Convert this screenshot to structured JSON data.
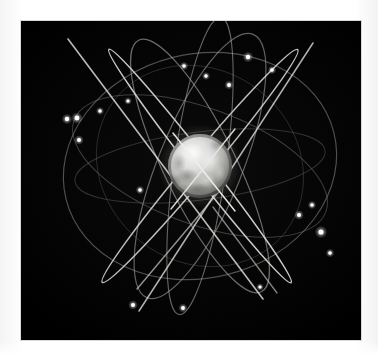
{
  "image": {
    "kind": "astronomy-render",
    "caption": "Satellite constellation orbiting a planet",
    "background_color": "#ffffff",
    "plate_color": "#000000",
    "plate": {
      "x": 21,
      "y": 21,
      "width": 340,
      "height": 319
    }
  },
  "planet": {
    "name": "planet-earth",
    "center_x": 200,
    "center_y": 166,
    "radius": 32,
    "highlight_color": "#f2f2f0",
    "midtone_color": "#b9b9b6",
    "shadow_color": "#2a2a2a",
    "terminator_side": "left-bottom"
  },
  "orbits": {
    "ring_color": "#9a9a9a",
    "bright_color": "#e8e8e4",
    "dim_color": "#5a5a5a",
    "items": [
      {
        "id": "orbit-1",
        "type": "ellipse",
        "label": "Inclined orbital plane 1",
        "rx": 138,
        "ry": 112,
        "rotate": -14,
        "opacity": 0.55
      },
      {
        "id": "orbit-2",
        "type": "ellipse",
        "label": "Inclined orbital plane 2",
        "rx": 134,
        "ry": 58,
        "rotate": 20,
        "opacity": 0.5
      },
      {
        "id": "orbit-3",
        "type": "ellipse",
        "label": "Inclined orbital plane 3",
        "rx": 126,
        "ry": 36,
        "rotate": -8,
        "opacity": 0.45
      },
      {
        "id": "orbit-4",
        "type": "ellipse",
        "label": "Polar orbital plane 4",
        "rx": 40,
        "ry": 142,
        "rotate": 22,
        "opacity": 0.7
      },
      {
        "id": "orbit-5",
        "type": "ellipse",
        "label": "Polar orbital plane 5",
        "rx": 34,
        "ry": 140,
        "rotate": -26,
        "opacity": 0.72
      },
      {
        "id": "orbit-6",
        "type": "ellipse",
        "label": "Edge-on orbital plane 6",
        "rx": 12,
        "ry": 150,
        "rotate": 40,
        "opacity": 0.85
      },
      {
        "id": "orbit-7",
        "type": "ellipse",
        "label": "Edge-on orbital plane 7",
        "rx": 10,
        "ry": 146,
        "rotate": -38,
        "opacity": 0.88
      }
    ]
  },
  "satellites": {
    "color": "#ffffff",
    "count": 18,
    "items": [
      {
        "id": "sat-01",
        "x": 67,
        "y": 119,
        "size": 2.2
      },
      {
        "id": "sat-02",
        "x": 77,
        "y": 118,
        "size": 2.4
      },
      {
        "id": "sat-03",
        "x": 79,
        "y": 140,
        "size": 2.0
      },
      {
        "id": "sat-04",
        "x": 100,
        "y": 111,
        "size": 1.7
      },
      {
        "id": "sat-05",
        "x": 128,
        "y": 101,
        "size": 1.6
      },
      {
        "id": "sat-06",
        "x": 140,
        "y": 190,
        "size": 1.8
      },
      {
        "id": "sat-07",
        "x": 184,
        "y": 66,
        "size": 1.8
      },
      {
        "id": "sat-08",
        "x": 206,
        "y": 76,
        "size": 1.7
      },
      {
        "id": "sat-09",
        "x": 229,
        "y": 85,
        "size": 1.9
      },
      {
        "id": "sat-10",
        "x": 248,
        "y": 57,
        "size": 2.2
      },
      {
        "id": "sat-11",
        "x": 272,
        "y": 70,
        "size": 1.8
      },
      {
        "id": "sat-12",
        "x": 299,
        "y": 215,
        "size": 2.0
      },
      {
        "id": "sat-13",
        "x": 312,
        "y": 205,
        "size": 1.8
      },
      {
        "id": "sat-14",
        "x": 321,
        "y": 232,
        "size": 2.6
      },
      {
        "id": "sat-15",
        "x": 330,
        "y": 253,
        "size": 1.8
      },
      {
        "id": "sat-16",
        "x": 133,
        "y": 305,
        "size": 2.0
      },
      {
        "id": "sat-17",
        "x": 183,
        "y": 308,
        "size": 1.9
      },
      {
        "id": "sat-18",
        "x": 260,
        "y": 287,
        "size": 1.6
      }
    ]
  }
}
